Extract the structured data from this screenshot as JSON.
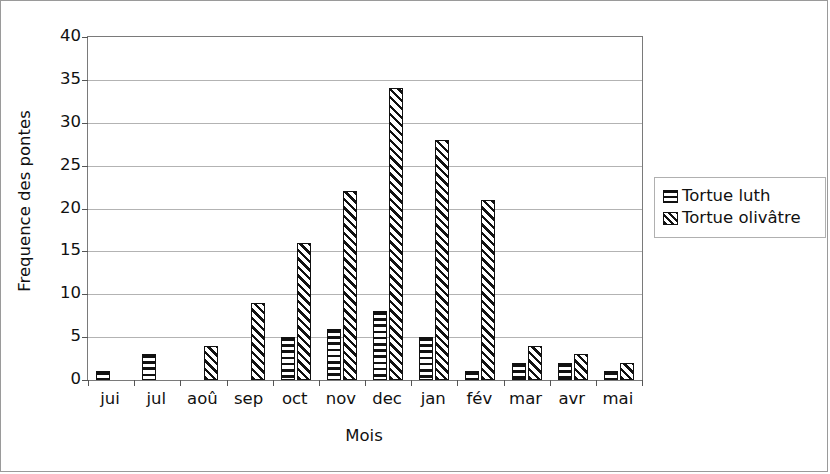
{
  "chart_data": {
    "type": "bar",
    "title": "",
    "xlabel": "Mois",
    "ylabel": "Frequence des pontes",
    "ylim": [
      0,
      40
    ],
    "ytick_step": 5,
    "yticks": [
      0,
      5,
      10,
      15,
      20,
      25,
      30,
      35,
      40
    ],
    "grid": true,
    "legend_position": "right",
    "categories": [
      "jui",
      "jul",
      "aoû",
      "sep",
      "oct",
      "nov",
      "dec",
      "jan",
      "fév",
      "mar",
      "avr",
      "mai"
    ],
    "series": [
      {
        "name": "Tortue luth",
        "pattern": "horizontal-stripes",
        "values": [
          1,
          3,
          0,
          0,
          5,
          6,
          8,
          5,
          1,
          2,
          2,
          1
        ]
      },
      {
        "name": "Tortue olivâtre",
        "pattern": "diagonal-stripes",
        "values": [
          0,
          0,
          4,
          9,
          16,
          22,
          34,
          28,
          21,
          4,
          3,
          2
        ]
      }
    ]
  },
  "legend": {
    "items": [
      {
        "label": "Tortue luth",
        "swatch": "horizontal-stripes-swatch"
      },
      {
        "label": "Tortue olivâtre",
        "swatch": "diagonal-stripes-swatch"
      }
    ]
  },
  "colors": {
    "ink": "#111111",
    "grid": "#b3b3b3",
    "axis": "#7a7a7a",
    "background": "#ffffff"
  }
}
